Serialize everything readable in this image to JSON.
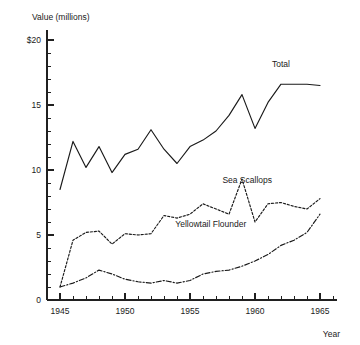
{
  "chart_data": {
    "type": "line",
    "title": "",
    "xlabel": "Year",
    "ylabel": "Value (millions)",
    "xlim": [
      1944,
      1966
    ],
    "ylim": [
      0,
      20
    ],
    "grid": false,
    "legend_position": "inline-right",
    "x_tick_labels": [
      "1945",
      "1950",
      "1955",
      "1960",
      "1965"
    ],
    "x_tick_values": [
      1945,
      1950,
      1955,
      1960,
      1965
    ],
    "x_minor_step": 1,
    "y_tick_labels": [
      "0",
      "5",
      "10",
      "15",
      "$20"
    ],
    "y_tick_values": [
      0,
      5,
      10,
      15,
      20
    ],
    "y_minor_step": 1,
    "x": [
      1945,
      1946,
      1947,
      1948,
      1949,
      1950,
      1951,
      1952,
      1953,
      1954,
      1955,
      1956,
      1957,
      1958,
      1959,
      1960,
      1961,
      1962,
      1963,
      1964,
      1965
    ],
    "series": [
      {
        "name": "Total",
        "style": "solid",
        "values": [
          8.5,
          12.2,
          10.2,
          11.8,
          9.8,
          11.2,
          11.6,
          13.1,
          11.6,
          10.5,
          11.8,
          12.3,
          13.0,
          14.2,
          15.8,
          13.2,
          15.2,
          16.6,
          16.6,
          16.6,
          16.5
        ]
      },
      {
        "name": "Sea Scallops",
        "style": "dotted",
        "values": [
          1.0,
          4.6,
          5.2,
          5.3,
          4.3,
          5.1,
          5.0,
          5.1,
          6.5,
          6.3,
          6.6,
          7.4,
          7.0,
          6.6,
          9.3,
          6.0,
          7.4,
          7.5,
          7.2,
          7.0,
          7.8
        ]
      },
      {
        "name": "Yellowtail Flounder",
        "style": "dash-dot",
        "values": [
          1.0,
          1.3,
          1.7,
          2.3,
          2.0,
          1.6,
          1.4,
          1.3,
          1.5,
          1.3,
          1.5,
          2.0,
          2.2,
          2.3,
          2.6,
          3.0,
          3.5,
          4.2,
          4.6,
          5.2,
          6.6
        ]
      }
    ],
    "annotations": [
      {
        "text": "Total",
        "x": 1962.0,
        "y": 17.9
      },
      {
        "text": "Sea Scallops",
        "x": 1959.4,
        "y": 9.0
      },
      {
        "text": "Yellowtail Flounder",
        "x": 1956.6,
        "y": 5.6
      }
    ]
  }
}
